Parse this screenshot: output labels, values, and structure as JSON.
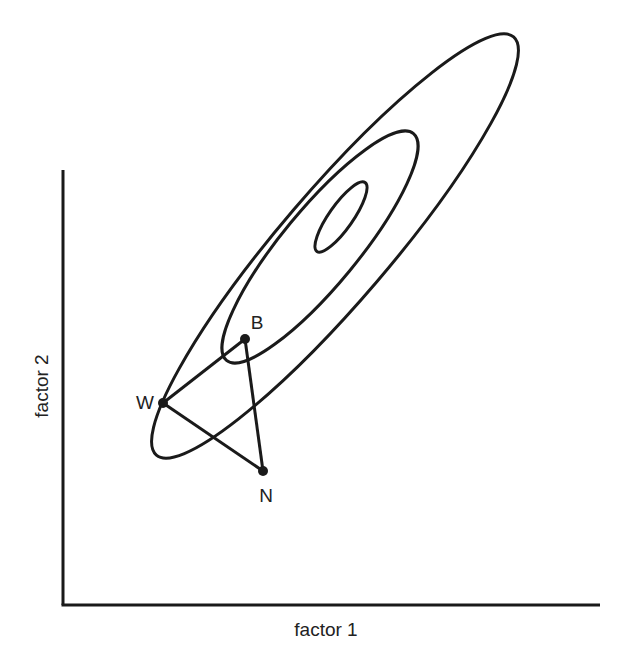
{
  "diagram": {
    "type": "contour-simplex",
    "axes": {
      "x_label": "factor 1",
      "y_label": "factor 2"
    },
    "contours": [
      {
        "name": "outer",
        "cx": 335,
        "cy": 246,
        "rx": 275,
        "ry": 55,
        "angle": -49.5
      },
      {
        "name": "middle",
        "cx": 320,
        "cy": 247,
        "rx": 147,
        "ry": 38,
        "angle": -50.5
      },
      {
        "name": "inner",
        "cx": 341,
        "cy": 217,
        "rx": 42,
        "ry": 12,
        "angle": -55
      }
    ],
    "points": [
      {
        "label": "B",
        "x": 245,
        "y": 339,
        "lx": 257,
        "ly": 329
      },
      {
        "label": "W",
        "x": 163,
        "y": 403,
        "lx": 145,
        "ly": 409
      },
      {
        "label": "N",
        "x": 263,
        "y": 471,
        "lx": 266,
        "ly": 502
      }
    ],
    "triangle_edges": [
      [
        "W",
        "B"
      ],
      [
        "B",
        "N"
      ],
      [
        "W",
        "N"
      ]
    ],
    "colors": {
      "stroke": "#1a1a1a",
      "text": "#222222",
      "background": "#ffffff"
    }
  }
}
